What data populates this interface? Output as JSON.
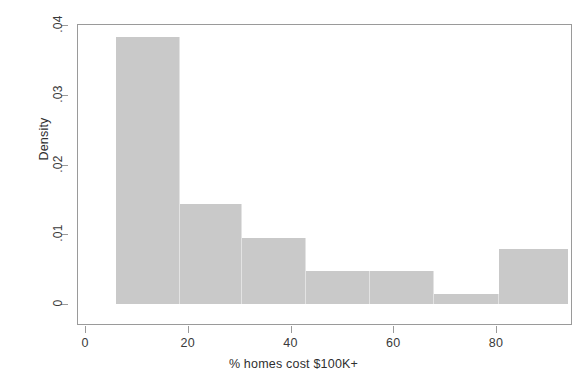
{
  "chart_data": {
    "type": "bar",
    "subtype": "histogram",
    "title": "",
    "xlabel": "% homes cost $100K+",
    "ylabel": "Density",
    "xlim": [
      0,
      96
    ],
    "ylim": [
      0,
      0.04
    ],
    "grid": false,
    "legend": null,
    "bar_color": "#c9c9c9",
    "bar_edge_color": "#e3e3e3",
    "axis_color": "#9a9a9a",
    "text_color": "#3a3a3a",
    "background": "#ffffff",
    "xticks": [
      0,
      20,
      40,
      60,
      80
    ],
    "xtick_labels": [
      "0",
      "20",
      "40",
      "60",
      "80"
    ],
    "yticks": [
      0,
      0.01,
      0.02,
      0.03,
      0.04
    ],
    "ytick_labels": [
      "0",
      ".01",
      ".02",
      ".03",
      ".04"
    ],
    "bin_edges": [
      6.0,
      18.5,
      30.5,
      43.0,
      55.5,
      68.0,
      80.5,
      94.0
    ],
    "values": [
      0.0383,
      0.0143,
      0.0095,
      0.0048,
      0.0048,
      0.0014,
      0.0079
    ],
    "bins": [
      {
        "x0": 6.0,
        "x1": 18.5,
        "density": 0.0383
      },
      {
        "x0": 18.5,
        "x1": 30.5,
        "density": 0.0143
      },
      {
        "x0": 30.5,
        "x1": 43.0,
        "density": 0.0095
      },
      {
        "x0": 43.0,
        "x1": 55.5,
        "density": 0.0048
      },
      {
        "x0": 55.5,
        "x1": 68.0,
        "density": 0.0048
      },
      {
        "x0": 68.0,
        "x1": 80.5,
        "density": 0.0014
      },
      {
        "x0": 80.5,
        "x1": 94.0,
        "density": 0.0079
      }
    ]
  }
}
